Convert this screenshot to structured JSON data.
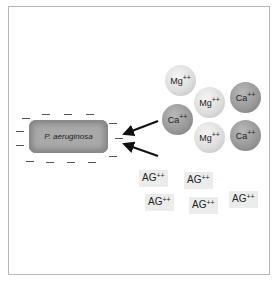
{
  "diagram": {
    "bacterium": {
      "label": "P. aeruginosa"
    },
    "ions": [
      {
        "symbol": "Mg",
        "charge": "++",
        "type": "magnesium",
        "x": 165,
        "y": 65
      },
      {
        "symbol": "Mg",
        "charge": "++",
        "type": "magnesium",
        "x": 194,
        "y": 87
      },
      {
        "symbol": "Ca",
        "charge": "++",
        "type": "calcium",
        "x": 230,
        "y": 82
      },
      {
        "symbol": "Ca",
        "charge": "++",
        "type": "calcium",
        "x": 162,
        "y": 104
      },
      {
        "symbol": "Mg",
        "charge": "++",
        "type": "magnesium",
        "x": 194,
        "y": 122
      },
      {
        "symbol": "Ca",
        "charge": "++",
        "type": "calcium",
        "x": 230,
        "y": 120
      }
    ],
    "aminoglycosides": [
      {
        "label": "AG",
        "charge": "++",
        "x": 139,
        "y": 170
      },
      {
        "label": "AG",
        "charge": "++",
        "x": 184,
        "y": 172
      },
      {
        "label": "AG",
        "charge": "++",
        "x": 145,
        "y": 194
      },
      {
        "label": "AG",
        "charge": "++",
        "x": 189,
        "y": 197
      },
      {
        "label": "AG",
        "charge": "++",
        "x": 229,
        "y": 191
      }
    ],
    "arrows": [
      {
        "from": "ca-ion-cluster",
        "to": "bacterium-surface"
      },
      {
        "from": "aminoglycoside-cluster",
        "to": "bacterium-surface"
      }
    ],
    "surface_charge": "negative"
  }
}
